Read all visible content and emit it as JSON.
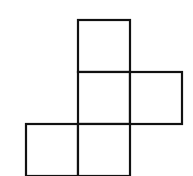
{
  "diagram": {
    "type": "square-net",
    "square_count": 5,
    "stroke_color": "#111111",
    "fill_color": "#ffffff",
    "stroke_width": 2.2,
    "cell_size": 52,
    "squares": [
      {
        "id": "top",
        "row": 0,
        "col": 1,
        "x": 78,
        "y": 20
      },
      {
        "id": "middle",
        "row": 1,
        "col": 1,
        "x": 78,
        "y": 72
      },
      {
        "id": "right",
        "row": 1,
        "col": 2,
        "x": 130,
        "y": 72
      },
      {
        "id": "bottom-left",
        "row": 2,
        "col": 0,
        "x": 26,
        "y": 124
      },
      {
        "id": "bottom-center",
        "row": 2,
        "col": 1,
        "x": 78,
        "y": 124
      }
    ]
  }
}
